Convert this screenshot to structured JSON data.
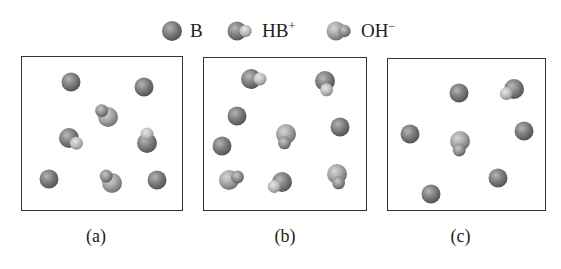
{
  "legend": {
    "items": [
      {
        "id": "B",
        "label": "B",
        "sup": "",
        "icon": "base-sphere-icon"
      },
      {
        "id": "HB",
        "label": "HB",
        "sup": "+",
        "icon": "conjugate-acid-icon"
      },
      {
        "id": "OH",
        "label": "OH",
        "sup": "−",
        "icon": "hydroxide-icon"
      }
    ]
  },
  "colors": {
    "B": "#7a7a7a",
    "HB_big": "#7d7d7d",
    "HB_small": "#bdbdbd",
    "OH_big": "#a9a9a9",
    "OH_small": "#8c8c8c",
    "border": "#333333"
  },
  "panels": [
    {
      "caption": "(a)",
      "box": {
        "x": 21,
        "y": 56,
        "w": 162,
        "h": 155
      },
      "particles": [
        {
          "type": "B",
          "x": 71,
          "y": 82
        },
        {
          "type": "B",
          "x": 144,
          "y": 87
        },
        {
          "type": "OH",
          "x": 108,
          "y": 117,
          "angle": -135
        },
        {
          "type": "HB",
          "x": 69,
          "y": 138,
          "angle": 35
        },
        {
          "type": "HB",
          "x": 147,
          "y": 143,
          "angle": -90
        },
        {
          "type": "B",
          "x": 49,
          "y": 179
        },
        {
          "type": "OH",
          "x": 112,
          "y": 183,
          "angle": -130
        },
        {
          "type": "B",
          "x": 157,
          "y": 180
        }
      ]
    },
    {
      "caption": "(b)",
      "box": {
        "x": 203,
        "y": 57,
        "w": 164,
        "h": 154
      },
      "particles": [
        {
          "type": "HB",
          "x": 251,
          "y": 79,
          "angle": 0
        },
        {
          "type": "HB",
          "x": 325,
          "y": 81,
          "angle": 80
        },
        {
          "type": "B",
          "x": 237,
          "y": 116
        },
        {
          "type": "OH",
          "x": 286,
          "y": 134,
          "angle": 100
        },
        {
          "type": "B",
          "x": 340,
          "y": 127
        },
        {
          "type": "B",
          "x": 222,
          "y": 146
        },
        {
          "type": "OH",
          "x": 229,
          "y": 180,
          "angle": -20
        },
        {
          "type": "HB",
          "x": 282,
          "y": 182,
          "angle": 150
        },
        {
          "type": "OH",
          "x": 337,
          "y": 174,
          "angle": 80
        }
      ]
    },
    {
      "caption": "(c)",
      "box": {
        "x": 387,
        "y": 58,
        "w": 159,
        "h": 153
      },
      "particles": [
        {
          "type": "B",
          "x": 459,
          "y": 93
        },
        {
          "type": "HB",
          "x": 514,
          "y": 89,
          "angle": 150
        },
        {
          "type": "B",
          "x": 410,
          "y": 134
        },
        {
          "type": "OH",
          "x": 460,
          "y": 141,
          "angle": 95
        },
        {
          "type": "B",
          "x": 524,
          "y": 131
        },
        {
          "type": "B",
          "x": 498,
          "y": 178
        },
        {
          "type": "B",
          "x": 431,
          "y": 194
        }
      ]
    }
  ]
}
